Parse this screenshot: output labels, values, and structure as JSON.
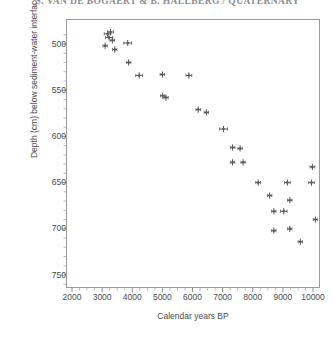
{
  "header": {
    "title": "S. VAN DE BOGAERT & B. HALLBERG / QUATERNARY"
  },
  "axis": {
    "x_label": "Calendar years BP",
    "y_label": "Depth (cm) below sediment-water interface",
    "x_ticks": [
      2000,
      3000,
      4000,
      5000,
      6000,
      7000,
      8000,
      9000,
      10000
    ],
    "y_ticks": [
      500,
      550,
      600,
      650,
      700,
      750
    ]
  },
  "chart_data": {
    "type": "scatter",
    "title": "",
    "xlabel": "Calendar years BP",
    "ylabel": "Depth (cm) below sediment-water interface",
    "xlim": [
      2000,
      10200
    ],
    "ylim": [
      760,
      478
    ],
    "y_inverted": true,
    "grid": false,
    "legend": "none",
    "marker": "plus-with-dot",
    "error_bars": "horizontal",
    "point_color": "#555555",
    "series": [
      {
        "name": "Calibrated radiocarbon ages",
        "points": [
          {
            "x": 3180,
            "y": 489,
            "xerr": 110
          },
          {
            "x": 3280,
            "y": 487,
            "xerr": 95
          },
          {
            "x": 3230,
            "y": 493,
            "xerr": 120
          },
          {
            "x": 3340,
            "y": 496,
            "xerr": 70
          },
          {
            "x": 3100,
            "y": 502,
            "xerr": 45
          },
          {
            "x": 3420,
            "y": 506,
            "xerr": 40
          },
          {
            "x": 3850,
            "y": 499,
            "xerr": 130
          },
          {
            "x": 3880,
            "y": 520,
            "xerr": 60
          },
          {
            "x": 4230,
            "y": 534,
            "xerr": 115
          },
          {
            "x": 5000,
            "y": 533,
            "xerr": 55
          },
          {
            "x": 5010,
            "y": 556,
            "xerr": 35
          },
          {
            "x": 5120,
            "y": 558,
            "xerr": 30
          },
          {
            "x": 5880,
            "y": 534,
            "xerr": 95
          },
          {
            "x": 6190,
            "y": 571,
            "xerr": 70
          },
          {
            "x": 6460,
            "y": 574,
            "xerr": 45
          },
          {
            "x": 7030,
            "y": 592,
            "xerr": 130
          },
          {
            "x": 7330,
            "y": 612,
            "xerr": 55
          },
          {
            "x": 7580,
            "y": 613,
            "xerr": 45
          },
          {
            "x": 7330,
            "y": 628,
            "xerr": 50
          },
          {
            "x": 7680,
            "y": 628,
            "xerr": 45
          },
          {
            "x": 8180,
            "y": 650,
            "xerr": 80
          },
          {
            "x": 8560,
            "y": 664,
            "xerr": 55
          },
          {
            "x": 9150,
            "y": 650,
            "xerr": 95
          },
          {
            "x": 9230,
            "y": 669,
            "xerr": 70
          },
          {
            "x": 8700,
            "y": 681,
            "xerr": 50
          },
          {
            "x": 9030,
            "y": 681,
            "xerr": 110
          },
          {
            "x": 8700,
            "y": 702,
            "xerr": 55
          },
          {
            "x": 9230,
            "y": 700,
            "xerr": 60
          },
          {
            "x": 9580,
            "y": 714,
            "xerr": 70
          },
          {
            "x": 9980,
            "y": 633,
            "xerr": 80
          },
          {
            "x": 9950,
            "y": 650,
            "xerr": 95
          },
          {
            "x": 10080,
            "y": 690,
            "xerr": 45
          }
        ]
      }
    ]
  }
}
